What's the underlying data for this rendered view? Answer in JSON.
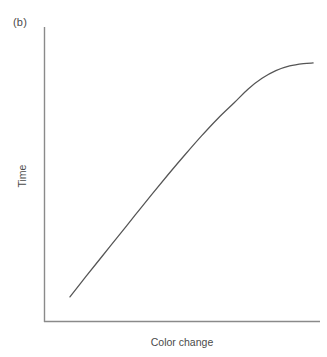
{
  "figure": {
    "panel_label": "(b)",
    "background_color": "#ffffff",
    "line_color": "#555555",
    "axis_color": "#8a8a8a",
    "text_color": "#4a4a4a"
  },
  "chart_data": {
    "type": "line",
    "title": "(b)",
    "xlabel": "Color change",
    "ylabel": "Time",
    "grid": false,
    "legend": null,
    "xticklabels": [],
    "yticklabels": [],
    "xlim": [
      0,
      1
    ],
    "ylim": [
      0,
      1
    ],
    "series": [
      {
        "name": "time-vs-color-change",
        "color": "#555555",
        "x": [
          0.094,
          0.15,
          0.21,
          0.27,
          0.33,
          0.39,
          0.45,
          0.51,
          0.57,
          0.63,
          0.69,
          0.74,
          0.79,
          0.84,
          0.89,
          0.94,
          0.975
        ],
        "y": [
          0.085,
          0.152,
          0.222,
          0.292,
          0.362,
          0.432,
          0.5,
          0.566,
          0.63,
          0.69,
          0.744,
          0.79,
          0.826,
          0.852,
          0.868,
          0.876,
          0.878
        ],
        "shape": "saturating-sigmoid"
      }
    ]
  },
  "geometry": {
    "axis_origin_x": 44,
    "axis_origin_y": 322,
    "axis_top_y": 27,
    "axis_right_x": 320,
    "curve_start": [
      70,
      297
    ],
    "curve_end": [
      313,
      126
    ]
  }
}
